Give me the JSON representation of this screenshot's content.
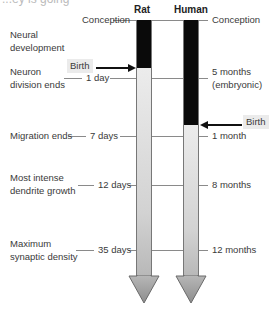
{
  "cut_off_text": "...ey is going",
  "columns": [
    {
      "label": "Rat",
      "birth_label": "Birth"
    },
    {
      "label": "Human",
      "birth_label": "Birth"
    }
  ],
  "stages": [
    {
      "label": "Conception",
      "rat": "Conception",
      "human": "Conception"
    },
    {
      "label": "Neural development"
    },
    {
      "label": "Neuron division ends",
      "rat": "1 day",
      "human": "5 months (embryonic)"
    },
    {
      "label": "Migration ends",
      "rat": "7 days",
      "human": "1 month"
    },
    {
      "label": "Most intense dendrite growth",
      "rat": "12 days",
      "human": "8 months"
    },
    {
      "label": "Maximum synaptic density",
      "rat": "35 days",
      "human": "12 months"
    }
  ],
  "text": {
    "rat_header": "Rat",
    "human_header": "Human",
    "conception_left": "Conception",
    "conception_right": "Conception",
    "neural_dev_1": "Neural",
    "neural_dev_2": "development",
    "neuron_div_1": "Neuron",
    "neuron_div_2": "division ends",
    "rat_1day": "1 day",
    "human_5months_1": "5 months",
    "human_5months_2": "(embryonic)",
    "birth_rat": "Birth",
    "birth_human": "Birth",
    "migration": "Migration ends",
    "rat_7days": "7 days",
    "human_1month": "1 month",
    "dendrite_1": "Most intense",
    "dendrite_2": "dendrite growth",
    "rat_12days": "12 days",
    "human_8months": "8 months",
    "synaptic_1": "Maximum",
    "synaptic_2": "synaptic density",
    "rat_35days": "35 days",
    "human_12months": "12 months"
  },
  "colors": {
    "prenatal": "#0a0a0a",
    "postnatal": "#e0e0e0",
    "lines": "#8a8a8a"
  }
}
